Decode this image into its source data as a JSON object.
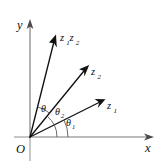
{
  "figure": {
    "kind": "complex-plane-argument-diagram",
    "background_color": "#ffffff",
    "ink_color": "#111111",
    "axis_color": "#9a9a9a",
    "arc_color": "#4f4f4f"
  },
  "axes": {
    "x_label": "x",
    "y_label": "y",
    "origin_label": "O",
    "x_axis": {
      "x_start": 14,
      "x_end": 153,
      "y": 137
    },
    "y_axis": {
      "x": 30,
      "y_top": 21,
      "y_bottom": 161
    }
  },
  "vectors": [
    {
      "name": "z1",
      "label_main": "z",
      "label_sub": "1",
      "origin": {
        "x": 30,
        "y": 137
      },
      "tip": {
        "x": 104,
        "y": 100
      },
      "label_pos": {
        "x": 108,
        "y": 107
      },
      "angle_deg": 26.6
    },
    {
      "name": "z2",
      "label_main": "z",
      "label_sub": "2",
      "origin": {
        "x": 30,
        "y": 137
      },
      "tip": {
        "x": 88,
        "y": 67
      },
      "label_pos": {
        "x": 92,
        "y": 74
      },
      "angle_deg": 50.4
    },
    {
      "name": "z1z2",
      "label_main": "z",
      "label_sub": "1",
      "label_main2": "z",
      "label_sub2": "2",
      "origin": {
        "x": 30,
        "y": 137
      },
      "tip": {
        "x": 56,
        "y": 36
      },
      "label_pos": {
        "x": 61,
        "y": 40
      },
      "angle_deg": 75.6
    }
  ],
  "angles": [
    {
      "name": "theta1",
      "symbol": "θ",
      "subscript": "1",
      "label_pos": {
        "x": 67,
        "y": 124
      },
      "arc_radius": 38,
      "from_deg": 0,
      "to_deg": 26.6,
      "description": "argument of z1 measured from positive x-axis"
    },
    {
      "name": "theta2",
      "symbol": "θ",
      "subscript": "2",
      "label_pos": {
        "x": 57,
        "y": 113
      },
      "arc_radius": 27,
      "from_deg": 0,
      "to_deg": 50.4,
      "description": "argument of z2 measured from positive x-axis"
    },
    {
      "name": "theta",
      "symbol": "θ",
      "subscript": "",
      "label_pos": {
        "x": 43,
        "y": 110
      },
      "arc_radius": 31,
      "from_deg": 50.4,
      "to_deg": 75.6,
      "description": "argument of product z1z2 measured from z2 direction"
    }
  ]
}
